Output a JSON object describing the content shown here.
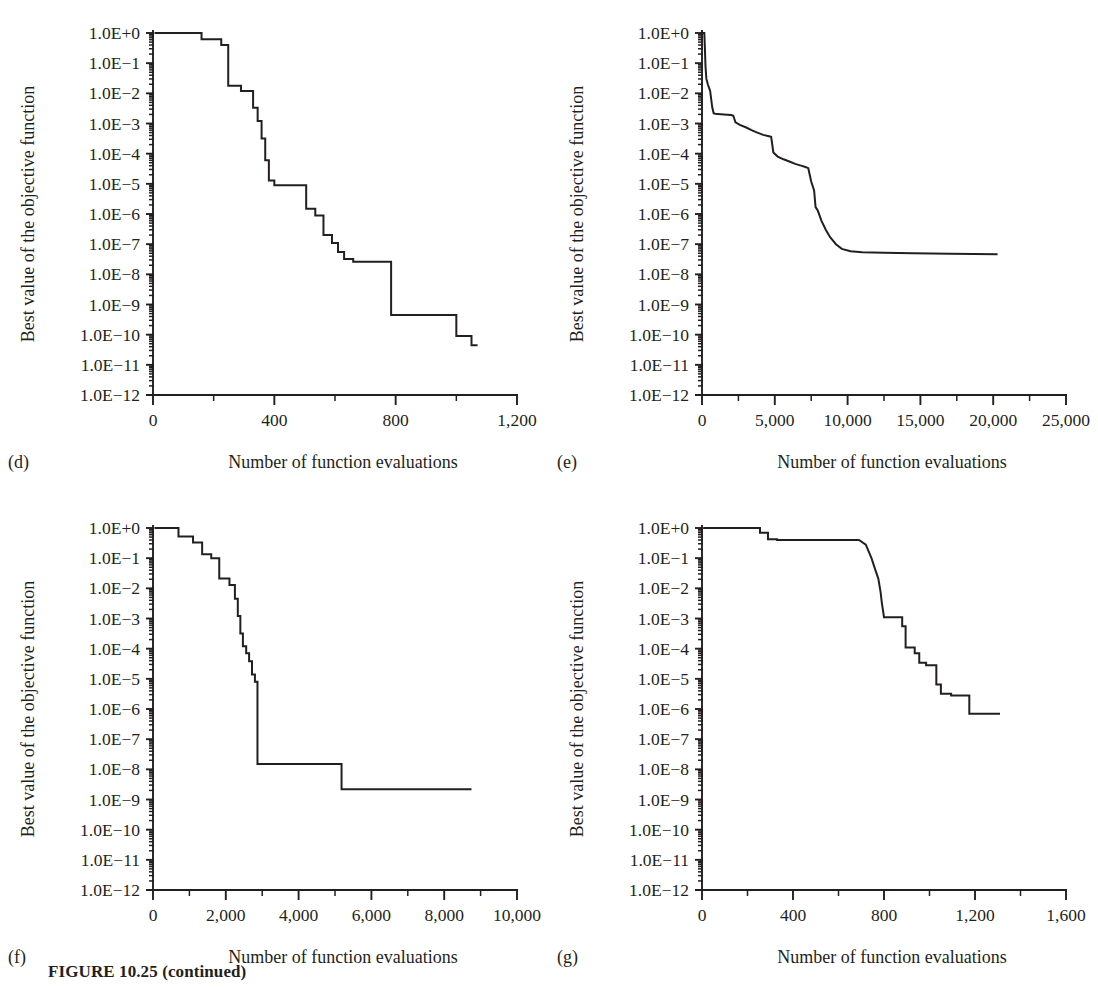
{
  "figure": {
    "caption": "FIGURE 10.25 (continued)",
    "ylabel": "Best value of the objective function",
    "xlabel": "Number of function evaluations"
  },
  "chart_data": [
    {
      "id": "d",
      "panel_letter": "(d)",
      "type": "line",
      "title": "",
      "xlabel": "Number of function evaluations",
      "ylabel": "Best value of the objective function",
      "yscale": "log",
      "ylim": [
        1e-12,
        1
      ],
      "xlim": [
        0,
        1200
      ],
      "xticks": [
        0,
        400,
        800,
        1200
      ],
      "xtick_labels": [
        "0",
        "400",
        "800",
        "1,200"
      ],
      "x_minor_step": 200,
      "ytick_labels": [
        "1.0E+0",
        "1.0E−1",
        "1.0E−2",
        "1.0E−3",
        "1.0E−4",
        "1.0E−5",
        "1.0E−6",
        "1.0E−7",
        "1.0E−8",
        "1.0E−9",
        "1.0E−10",
        "1.0E−11",
        "1.0E−12"
      ],
      "ytick_exponents": [
        0,
        -1,
        -2,
        -3,
        -4,
        -5,
        -6,
        -7,
        -8,
        -9,
        -10,
        -11,
        -12
      ],
      "grid": false,
      "legend": "none",
      "points": [
        [
          5,
          1.0
        ],
        [
          160,
          1.0
        ],
        [
          160,
          0.62
        ],
        [
          225,
          0.62
        ],
        [
          225,
          0.4
        ],
        [
          248,
          0.4
        ],
        [
          248,
          0.018
        ],
        [
          290,
          0.018
        ],
        [
          290,
          0.012
        ],
        [
          330,
          0.012
        ],
        [
          330,
          0.0033
        ],
        [
          345,
          0.0033
        ],
        [
          345,
          0.0012
        ],
        [
          358,
          0.0012
        ],
        [
          358,
          0.00032
        ],
        [
          370,
          0.00032
        ],
        [
          370,
          6e-05
        ],
        [
          382,
          6e-05
        ],
        [
          382,
          1.3e-05
        ],
        [
          400,
          1.3e-05
        ],
        [
          400,
          9e-06
        ],
        [
          505,
          9e-06
        ],
        [
          505,
          1.5e-06
        ],
        [
          535,
          1.5e-06
        ],
        [
          535,
          9e-07
        ],
        [
          562,
          9e-07
        ],
        [
          562,
          2e-07
        ],
        [
          590,
          2e-07
        ],
        [
          590,
          1.1e-07
        ],
        [
          610,
          1.1e-07
        ],
        [
          610,
          5.5e-08
        ],
        [
          630,
          5.5e-08
        ],
        [
          630,
          3.2e-08
        ],
        [
          660,
          3.2e-08
        ],
        [
          660,
          2.6e-08
        ],
        [
          785,
          2.6e-08
        ],
        [
          785,
          4.5e-10
        ],
        [
          1000,
          4.5e-10
        ],
        [
          1000,
          9e-11
        ],
        [
          1050,
          9e-11
        ],
        [
          1050,
          4.5e-11
        ],
        [
          1070,
          4.5e-11
        ]
      ]
    },
    {
      "id": "e",
      "panel_letter": "(e)",
      "type": "line",
      "title": "",
      "xlabel": "Number of function evaluations",
      "ylabel": "Best value of the objective function",
      "yscale": "log",
      "ylim": [
        1e-12,
        1
      ],
      "xlim": [
        0,
        25000
      ],
      "xticks": [
        0,
        5000,
        10000,
        15000,
        20000,
        25000
      ],
      "xtick_labels": [
        "0",
        "5,000",
        "10,000",
        "15,000",
        "20,000",
        "25,000"
      ],
      "x_minor_step": 2500,
      "ytick_labels": [
        "1.0E+0",
        "1.0E−1",
        "1.0E−2",
        "1.0E−3",
        "1.0E−4",
        "1.0E−5",
        "1.0E−6",
        "1.0E−7",
        "1.0E−8",
        "1.0E−9",
        "1.0E−10",
        "1.0E−11",
        "1.0E−12"
      ],
      "ytick_exponents": [
        0,
        -1,
        -2,
        -3,
        -4,
        -5,
        -6,
        -7,
        -8,
        -9,
        -10,
        -11,
        -12
      ],
      "grid": false,
      "legend": "none",
      "points": [
        [
          60,
          1.0
        ],
        [
          160,
          1.0
        ],
        [
          200,
          0.3
        ],
        [
          240,
          0.08
        ],
        [
          300,
          0.03
        ],
        [
          400,
          0.02
        ],
        [
          560,
          0.012
        ],
        [
          700,
          0.0035
        ],
        [
          800,
          0.0022
        ],
        [
          900,
          0.0021
        ],
        [
          1500,
          0.002
        ],
        [
          2000,
          0.0019
        ],
        [
          2150,
          0.0018
        ],
        [
          2300,
          0.0011
        ],
        [
          2600,
          0.0009
        ],
        [
          3000,
          0.00075
        ],
        [
          3400,
          0.0006
        ],
        [
          3800,
          0.0005
        ],
        [
          4200,
          0.00042
        ],
        [
          4600,
          0.00038
        ],
        [
          4750,
          0.00036
        ],
        [
          4900,
          0.00011
        ],
        [
          5200,
          8e-05
        ],
        [
          5600,
          6.5e-05
        ],
        [
          6000,
          5.5e-05
        ],
        [
          6400,
          4.6e-05
        ],
        [
          6800,
          4e-05
        ],
        [
          7100,
          3.6e-05
        ],
        [
          7300,
          3.3e-05
        ],
        [
          7500,
          1.2e-05
        ],
        [
          7700,
          6e-06
        ],
        [
          7800,
          1.7e-06
        ],
        [
          7950,
          1.3e-06
        ],
        [
          8200,
          6e-07
        ],
        [
          8500,
          3e-07
        ],
        [
          8800,
          1.7e-07
        ],
        [
          9200,
          1e-07
        ],
        [
          9600,
          7e-08
        ],
        [
          10200,
          5.8e-08
        ],
        [
          11000,
          5.4e-08
        ],
        [
          12500,
          5.2e-08
        ],
        [
          14500,
          5e-08
        ],
        [
          17000,
          4.8e-08
        ],
        [
          20300,
          4.6e-08
        ]
      ]
    },
    {
      "id": "f",
      "panel_letter": "(f)",
      "type": "line",
      "title": "",
      "xlabel": "Number of function evaluations",
      "ylabel": "Best value of the objective function",
      "yscale": "log",
      "ylim": [
        1e-12,
        1
      ],
      "xlim": [
        0,
        10000
      ],
      "xticks": [
        0,
        2000,
        4000,
        6000,
        8000,
        10000
      ],
      "xtick_labels": [
        "0",
        "2,000",
        "4,000",
        "6,000",
        "8,000",
        "10,000"
      ],
      "x_minor_step": 1000,
      "ytick_labels": [
        "1.0E+0",
        "1.0E−1",
        "1.0E−2",
        "1.0E−3",
        "1.0E−4",
        "1.0E−5",
        "1.0E−6",
        "1.0E−7",
        "1.0E−8",
        "1.0E−9",
        "1.0E−10",
        "1.0E−11",
        "1.0E−12"
      ],
      "ytick_exponents": [
        0,
        -1,
        -2,
        -3,
        -4,
        -5,
        -6,
        -7,
        -8,
        -9,
        -10,
        -11,
        -12
      ],
      "grid": false,
      "legend": "none",
      "points": [
        [
          40,
          1.0
        ],
        [
          700,
          1.0
        ],
        [
          700,
          0.52
        ],
        [
          1100,
          0.52
        ],
        [
          1100,
          0.33
        ],
        [
          1350,
          0.33
        ],
        [
          1350,
          0.135
        ],
        [
          1600,
          0.135
        ],
        [
          1600,
          0.1
        ],
        [
          1820,
          0.1
        ],
        [
          1820,
          0.021
        ],
        [
          2100,
          0.021
        ],
        [
          2100,
          0.013
        ],
        [
          2250,
          0.013
        ],
        [
          2250,
          0.0045
        ],
        [
          2330,
          0.0045
        ],
        [
          2330,
          0.0012
        ],
        [
          2400,
          0.0012
        ],
        [
          2400,
          0.00032
        ],
        [
          2470,
          0.00032
        ],
        [
          2470,
          0.00012
        ],
        [
          2560,
          0.00012
        ],
        [
          2560,
          7e-05
        ],
        [
          2640,
          7e-05
        ],
        [
          2640,
          3.8e-05
        ],
        [
          2720,
          3.8e-05
        ],
        [
          2720,
          1.4e-05
        ],
        [
          2800,
          1.4e-05
        ],
        [
          2800,
          8e-06
        ],
        [
          2870,
          8e-06
        ],
        [
          2870,
          1.5e-08
        ],
        [
          3020,
          1.5e-08
        ],
        [
          5180,
          1.5e-08
        ],
        [
          5180,
          2.2e-09
        ],
        [
          5280,
          2.2e-09
        ],
        [
          8750,
          2.2e-09
        ]
      ]
    },
    {
      "id": "g",
      "panel_letter": "(g)",
      "type": "line",
      "title": "",
      "xlabel": "Number of function evaluations",
      "ylabel": "Best value of the objective function",
      "yscale": "log",
      "ylim": [
        1e-12,
        1
      ],
      "xlim": [
        0,
        1600
      ],
      "xticks": [
        0,
        400,
        800,
        1200,
        1600
      ],
      "xtick_labels": [
        "0",
        "400",
        "800",
        "1,200",
        "1,600"
      ],
      "x_minor_step": 200,
      "ytick_labels": [
        "1.0E+0",
        "1.0E−1",
        "1.0E−2",
        "1.0E−3",
        "1.0E−4",
        "1.0E−5",
        "1.0E−6",
        "1.0E−7",
        "1.0E−8",
        "1.0E−9",
        "1.0E−10",
        "1.0E−11",
        "1.0E−12"
      ],
      "ytick_exponents": [
        0,
        -1,
        -2,
        -3,
        -4,
        -5,
        -6,
        -7,
        -8,
        -9,
        -10,
        -11,
        -12
      ],
      "grid": false,
      "legend": "none",
      "points": [
        [
          5,
          1.0
        ],
        [
          255,
          1.0
        ],
        [
          255,
          0.7
        ],
        [
          290,
          0.7
        ],
        [
          290,
          0.42
        ],
        [
          330,
          0.42
        ],
        [
          330,
          0.4
        ],
        [
          690,
          0.4
        ],
        [
          720,
          0.28
        ],
        [
          745,
          0.1
        ],
        [
          760,
          0.045
        ],
        [
          775,
          0.021
        ],
        [
          785,
          0.0075
        ],
        [
          790,
          0.0035
        ],
        [
          800,
          0.0011
        ],
        [
          880,
          0.0011
        ],
        [
          880,
          0.00055
        ],
        [
          895,
          0.00055
        ],
        [
          895,
          0.00011
        ],
        [
          935,
          0.00011
        ],
        [
          935,
          7e-05
        ],
        [
          955,
          7e-05
        ],
        [
          955,
          3.4e-05
        ],
        [
          985,
          3.4e-05
        ],
        [
          985,
          2.8e-05
        ],
        [
          1030,
          2.8e-05
        ],
        [
          1030,
          6.5e-06
        ],
        [
          1050,
          6.5e-06
        ],
        [
          1050,
          3.2e-06
        ],
        [
          1095,
          3.2e-06
        ],
        [
          1095,
          2.8e-06
        ],
        [
          1175,
          2.8e-06
        ],
        [
          1175,
          7e-07
        ],
        [
          1205,
          7e-07
        ],
        [
          1310,
          7e-07
        ]
      ]
    }
  ]
}
